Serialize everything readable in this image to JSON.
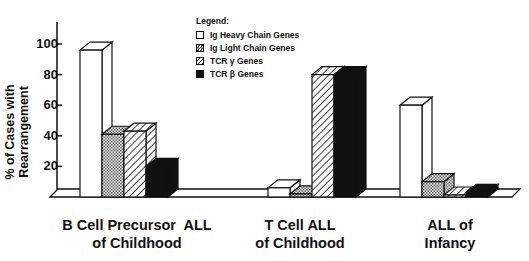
{
  "chart_data": {
    "type": "bar",
    "title": "",
    "xlabel": "",
    "ylabel": "% of Cases with Rearrangement",
    "ylim": [
      0,
      110
    ],
    "yticks": [
      20,
      40,
      60,
      80,
      100
    ],
    "grid": false,
    "legend_position": "top-center",
    "categories": [
      "B Cell Precursor ALL of Childhood",
      "T Cell ALL of Childhood",
      "ALL of Infancy"
    ],
    "series": [
      {
        "name": "Ig Heavy Chain Genes",
        "pattern": "white",
        "values": [
          96,
          6,
          60
        ]
      },
      {
        "name": "Ig Light Chain Genes",
        "pattern": "stipple",
        "values": [
          41,
          2,
          10
        ]
      },
      {
        "name": "TCR γ Genes",
        "pattern": "diagonal-hatch",
        "values": [
          43,
          80,
          1
        ]
      },
      {
        "name": "TCR β Genes",
        "pattern": "black",
        "values": [
          20,
          80,
          3
        ]
      }
    ]
  },
  "axis": {
    "ylabel": "% of Cases with Rearrangement",
    "ticks": [
      "20",
      "40",
      "60",
      "80",
      "100"
    ]
  },
  "legend": {
    "title": "Legend:",
    "items": [
      "Ig Heavy Chain Genes",
      "Ig Light Chain Genes",
      "TCR γ Genes",
      "TCR β Genes"
    ]
  },
  "categories": [
    {
      "line1": "B Cell Precursor  ALL",
      "line2": "of Childhood"
    },
    {
      "line1": "T Cell ALL",
      "line2": "of Childhood"
    },
    {
      "line1": "ALL of",
      "line2": "Infancy"
    }
  ],
  "colors": {
    "ink": "#111111",
    "background": "#ffffff",
    "stipple": "#9a9a9a"
  }
}
